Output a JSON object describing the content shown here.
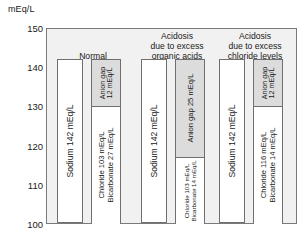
{
  "axis": {
    "unit_label": "mEq/L",
    "ticks": [
      150,
      140,
      130,
      120,
      110,
      100
    ],
    "min": 100,
    "max": 150
  },
  "groups": [
    {
      "title_lines": [
        "Normal",
        "",
        ""
      ],
      "cation": {
        "label": "Sodium 142 mEq/L",
        "top_value": 142,
        "bottom_value": 100
      },
      "anion_gap": {
        "label_line1": "Anion gap",
        "label_line2": "12 mEq/L",
        "top_value": 142,
        "bottom_value": 130
      },
      "anion_base": {
        "label_line1": "Chloride 103 mEq/L",
        "label_line2": "Bicarbonate 27 mEq/L",
        "top_value": 130,
        "bottom_value": 100
      }
    },
    {
      "title_lines": [
        "Acidosis",
        "due to excess",
        "organic acids"
      ],
      "cation": {
        "label": "Sodium 142 mEq/L",
        "top_value": 142,
        "bottom_value": 100
      },
      "anion_gap": {
        "label_line1": "Anion gap 25 mEq/L",
        "label_line2": "",
        "top_value": 142,
        "bottom_value": 117
      },
      "anion_base": {
        "label_line1": "Chloride 103 mEq/L",
        "label_line2": "Bicarbonate 14 mEq/L",
        "top_value": 117,
        "bottom_value": 100
      }
    },
    {
      "title_lines": [
        "Acidosis",
        "due to excess",
        "chloride levels"
      ],
      "cation": {
        "label": "Sodium 142 mEq/L",
        "top_value": 142,
        "bottom_value": 100
      },
      "anion_gap": {
        "label_line1": "Anion gap",
        "label_line2": "12 mEq/L",
        "top_value": 142,
        "bottom_value": 130
      },
      "anion_base": {
        "label_line1": "Chloride 116 mEq/L",
        "label_line2": "Bicarbonate 14 mEq/L",
        "top_value": 130,
        "bottom_value": 100
      }
    }
  ],
  "chart_data": {
    "type": "bar",
    "title": "",
    "xlabel": "",
    "ylabel": "mEq/L",
    "ylim": [
      100,
      150
    ],
    "yticks": [
      100,
      110,
      120,
      130,
      140,
      150
    ],
    "grid": false,
    "legend": "none",
    "note": "Gamblegram: stacked cation vs anion columns per clinical condition",
    "categories": [
      "Normal",
      "Acidosis due to excess organic acids",
      "Acidosis due to excess chloride levels"
    ],
    "series": [
      {
        "name": "Sodium (cation column)",
        "values": [
          142,
          142,
          142
        ],
        "units": "mEq/L",
        "baseline": 100
      },
      {
        "name": "Chloride (anion column, lower segment)",
        "values": [
          103,
          103,
          116
        ],
        "units": "mEq/L"
      },
      {
        "name": "Bicarbonate (anion column, lower segment)",
        "values": [
          27,
          14,
          14
        ],
        "units": "mEq/L"
      },
      {
        "name": "Anion gap (anion column, upper shaded segment)",
        "values": [
          12,
          25,
          12
        ],
        "units": "mEq/L"
      }
    ],
    "anion_column_totals": [
      142,
      142,
      142
    ],
    "anion_base_tops": [
      130,
      117,
      130
    ]
  }
}
